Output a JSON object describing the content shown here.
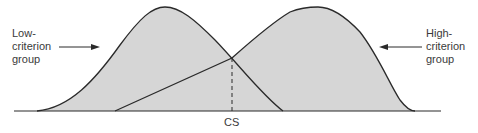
{
  "diagram": {
    "type": "overlapping-distributions",
    "low_group": {
      "label_line1": "Low-",
      "label_line2": "criterion",
      "label_line3": "group"
    },
    "high_group": {
      "label_line1": "High-",
      "label_line2": "criterion",
      "label_line3": "group"
    },
    "cutoff_label": "CS",
    "colors": {
      "fill": "#d6d6d6",
      "stroke": "#2a2a2a",
      "background": "#ffffff"
    }
  }
}
